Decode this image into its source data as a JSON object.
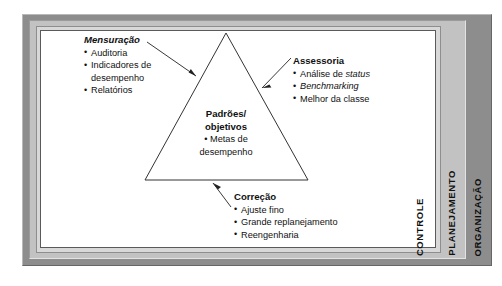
{
  "figure": {
    "title_visible": false,
    "colors": {
      "frame_outer": "#8d8d8d",
      "frame_mid": "#c2c2c2",
      "frame_inner": "#d8d8d8",
      "panel": "#ffffff",
      "line": "#333333",
      "text": "#111111"
    }
  },
  "side_labels": {
    "controle": "CONTROLE",
    "planejamento": "PLANEJAMENTO",
    "organizacao": "ORGANIZAÇÃO"
  },
  "triangle": {
    "center": {
      "heading_line1": "Padrões/",
      "heading_line2": "objetivos",
      "bullet1_line1": "• Metas de",
      "bullet1_line2": "desempenho"
    }
  },
  "callouts": [
    {
      "id": "mensuracao",
      "heading": "Mensuração",
      "heading_style": "bold-italic",
      "items": [
        {
          "text": "Auditoria",
          "continuation": false
        },
        {
          "text": "Indicadores de",
          "continuation": false
        },
        {
          "text": "desempenho",
          "continuation": true
        },
        {
          "text": "Relatórios",
          "continuation": false
        }
      ]
    },
    {
      "id": "assessoria",
      "heading": "Assessoria",
      "heading_style": "bold",
      "items": [
        {
          "text": "Análise de ",
          "italic_tail": "status",
          "continuation": false
        },
        {
          "text": "",
          "italic_tail": "Benchmarking",
          "continuation": false
        },
        {
          "text": "Melhor da classe",
          "continuation": false
        }
      ]
    },
    {
      "id": "correcao",
      "heading": "Correção",
      "heading_style": "bold",
      "items": [
        {
          "text": "Ajuste fino",
          "continuation": false
        },
        {
          "text": "Grande replanejamento",
          "continuation": false
        },
        {
          "text": "Reengenharia",
          "continuation": false
        }
      ]
    }
  ]
}
